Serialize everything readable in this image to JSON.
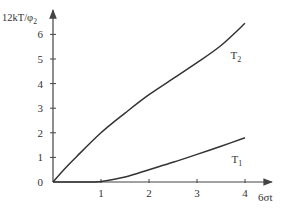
{
  "chart_data": {
    "type": "line",
    "title": "",
    "xlabel": "6σt",
    "ylabel": "12kT/φ₂",
    "ylabel_main": "12kT/φ",
    "ylabel_sub": "2",
    "xlim": [
      0,
      4.4
    ],
    "ylim": [
      0,
      6.8
    ],
    "x_ticks": [
      1,
      2,
      3,
      4
    ],
    "y_ticks": [
      0,
      1,
      2,
      3,
      4,
      5,
      6
    ],
    "x_tick_labels": [
      "1",
      "2",
      "3",
      "4"
    ],
    "y_tick_labels": [
      "0",
      "1",
      "2",
      "3",
      "4",
      "5",
      "6"
    ],
    "grid": false,
    "legend": "inline labels at curve ends",
    "series": [
      {
        "name": "T2",
        "label_main": "T",
        "label_sub": "2",
        "x": [
          0,
          0.25,
          0.5,
          1,
          1.5,
          2,
          2.5,
          3,
          3.5,
          4
        ],
        "y": [
          0,
          0.55,
          1.05,
          2.0,
          2.8,
          3.55,
          4.2,
          4.85,
          5.55,
          6.45
        ]
      },
      {
        "name": "T1",
        "label_main": "T",
        "label_sub": "1",
        "x": [
          0,
          0.5,
          1,
          1.5,
          2,
          2.5,
          3,
          3.5,
          4
        ],
        "y": [
          0,
          0,
          0.02,
          0.2,
          0.5,
          0.8,
          1.12,
          1.45,
          1.8
        ]
      }
    ]
  },
  "colors": {
    "line": "#333333",
    "axis": "#444444",
    "text": "#333333"
  }
}
